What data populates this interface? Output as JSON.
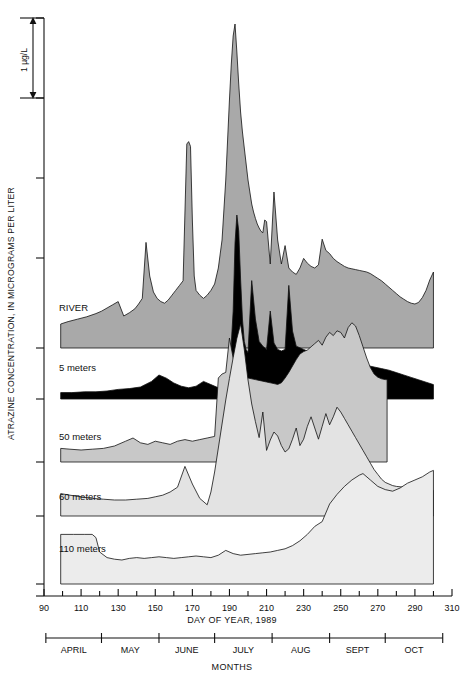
{
  "figure": {
    "y_axis_title": "ATRAZINE CONCENTRATION, IN MICROGRAMS PER LITER",
    "x_axis_title": "DAY OF YEAR, 1989",
    "months_title": "MONTHS",
    "scale_bar_label": "1 µg/L"
  },
  "chart_data": {
    "type": "area",
    "title": "",
    "subtitle": "",
    "xlabel": "DAY OF YEAR, 1989",
    "ylabel": "ATRAZINE CONCENTRATION, IN MICROGRAMS PER LITER",
    "xlim": [
      90,
      310
    ],
    "xticks": [
      90,
      110,
      130,
      150,
      170,
      190,
      210,
      230,
      250,
      270,
      290,
      310
    ],
    "xtick_labels": [
      "90",
      "110",
      "130",
      "150",
      "170",
      "190",
      "210",
      "230",
      "250",
      "270",
      "290",
      "310"
    ],
    "x_minor_tick_step": 10,
    "grid": false,
    "legend": "inline-labels",
    "y_unit": "micrograms per liter",
    "y_scale_bar": {
      "label": "1 µg/L",
      "value": 1
    },
    "stacked_offset_panels": true,
    "months_axis": {
      "label": "MONTHS",
      "labels": [
        "APRIL",
        "MAY",
        "JUNE",
        "JULY",
        "AUG",
        "SEPT",
        "OCT"
      ],
      "boundaries": [
        91,
        121,
        152,
        182,
        213,
        244,
        274,
        305
      ]
    },
    "series": [
      {
        "name": "RIVER",
        "fill": "#a9a9a9",
        "baseline_value": 0,
        "x": [
          99,
          103,
          108,
          113,
          118,
          121,
          124,
          127,
          130,
          133,
          136,
          139,
          141,
          143,
          145,
          147,
          149,
          151,
          153,
          155,
          157,
          159,
          161,
          163,
          165,
          167,
          168,
          169,
          170,
          171,
          172,
          174,
          176,
          178,
          180,
          182,
          184,
          186,
          188,
          190,
          191,
          192,
          193,
          194,
          195,
          196,
          197,
          198,
          199,
          200,
          201,
          202,
          203,
          204,
          205,
          206,
          207,
          208,
          209,
          210,
          212,
          214,
          216,
          218,
          220,
          222,
          224,
          226,
          228,
          230,
          232,
          234,
          236,
          238,
          240,
          242,
          244,
          246,
          248,
          250,
          252,
          254,
          256,
          258,
          260,
          262,
          264,
          266,
          268,
          270,
          272,
          274,
          276,
          278,
          280,
          282,
          284,
          286,
          288,
          290,
          292,
          294,
          296,
          298,
          300
        ],
        "y": [
          0.3,
          0.33,
          0.36,
          0.39,
          0.43,
          0.46,
          0.5,
          0.54,
          0.58,
          0.4,
          0.44,
          0.49,
          0.55,
          0.62,
          1.32,
          0.9,
          0.7,
          0.62,
          0.58,
          0.56,
          0.6,
          0.66,
          0.72,
          0.78,
          0.84,
          2.55,
          2.58,
          2.52,
          1.6,
          0.9,
          0.72,
          0.66,
          0.62,
          0.66,
          0.72,
          0.8,
          1.0,
          1.35,
          2.1,
          3.1,
          3.55,
          3.9,
          4.05,
          3.7,
          3.3,
          2.95,
          2.7,
          2.5,
          2.3,
          2.1,
          1.95,
          1.8,
          1.7,
          1.62,
          1.55,
          1.5,
          1.46,
          1.44,
          1.6,
          1.58,
          1.05,
          1.95,
          1.35,
          1.05,
          1.28,
          1.0,
          0.95,
          0.92,
          1.0,
          1.12,
          1.06,
          1.02,
          1.0,
          1.04,
          1.36,
          1.22,
          1.18,
          1.12,
          1.08,
          1.05,
          1.02,
          1.0,
          0.99,
          0.98,
          0.97,
          0.96,
          0.95,
          0.93,
          0.9,
          0.87,
          0.84,
          0.8,
          0.76,
          0.72,
          0.68,
          0.64,
          0.61,
          0.58,
          0.56,
          0.55,
          0.57,
          0.63,
          0.72,
          0.85,
          0.95
        ]
      },
      {
        "name": "5 meters",
        "fill": "#000000",
        "baseline_value": 0,
        "x": [
          99,
          105,
          112,
          118,
          124,
          130,
          136,
          142,
          148,
          152,
          156,
          160,
          164,
          168,
          172,
          176,
          180,
          184,
          188,
          190,
          192,
          193,
          194,
          195,
          196,
          197,
          198,
          199,
          200,
          202,
          204,
          206,
          208,
          210,
          212,
          214,
          216,
          218,
          220,
          222,
          224,
          226,
          228,
          230,
          232,
          234,
          236,
          238,
          240,
          244,
          248,
          252,
          256,
          260,
          264,
          268,
          272,
          276,
          280,
          284,
          288,
          292,
          296,
          300
        ],
        "y": [
          0.08,
          0.08,
          0.09,
          0.09,
          0.1,
          0.12,
          0.13,
          0.15,
          0.22,
          0.3,
          0.26,
          0.2,
          0.16,
          0.14,
          0.16,
          0.22,
          0.18,
          0.14,
          0.12,
          0.3,
          1.1,
          1.95,
          2.3,
          2.1,
          1.5,
          1.0,
          0.72,
          0.62,
          0.58,
          1.48,
          1.0,
          0.72,
          0.66,
          0.62,
          1.1,
          0.7,
          0.62,
          0.6,
          0.62,
          1.42,
          0.85,
          0.66,
          0.64,
          0.62,
          0.6,
          0.58,
          0.56,
          0.55,
          0.54,
          0.52,
          0.5,
          0.48,
          0.46,
          0.44,
          0.42,
          0.4,
          0.38,
          0.36,
          0.33,
          0.3,
          0.27,
          0.24,
          0.21,
          0.18
        ]
      },
      {
        "name": "50 meters",
        "fill": "#c8c8c8",
        "baseline_value": 0,
        "x": [
          99,
          104,
          110,
          116,
          122,
          128,
          134,
          138,
          142,
          146,
          150,
          154,
          158,
          162,
          166,
          170,
          174,
          178,
          182,
          184,
          186,
          188,
          190,
          192,
          194,
          196,
          198,
          200,
          202,
          204,
          206,
          208,
          210,
          212,
          214,
          216,
          218,
          220,
          222,
          224,
          226,
          228,
          230,
          232,
          234,
          236,
          238,
          240,
          242,
          244,
          246,
          248,
          250,
          252,
          254,
          256,
          258,
          260,
          262,
          264,
          266,
          268,
          270,
          272,
          274,
          275
        ],
        "y": [
          0.17,
          0.16,
          0.15,
          0.16,
          0.17,
          0.2,
          0.26,
          0.3,
          0.24,
          0.22,
          0.26,
          0.24,
          0.22,
          0.26,
          0.28,
          0.26,
          0.28,
          0.3,
          0.32,
          1.05,
          1.1,
          1.12,
          1.55,
          1.3,
          1.12,
          1.08,
          1.06,
          1.05,
          1.04,
          1.03,
          1.02,
          1.01,
          1.0,
          0.99,
          0.98,
          0.97,
          0.99,
          1.05,
          1.12,
          1.2,
          1.28,
          1.35,
          1.38,
          1.4,
          1.44,
          1.48,
          1.52,
          1.46,
          1.56,
          1.62,
          1.58,
          1.64,
          1.62,
          1.55,
          1.68,
          1.74,
          1.7,
          1.58,
          1.44,
          1.3,
          1.18,
          1.1,
          1.06,
          1.04,
          1.03,
          1.03
        ]
      },
      {
        "name": "60 meters",
        "fill": "#e3e3e3",
        "baseline_value": 0,
        "x": [
          99,
          104,
          110,
          116,
          122,
          128,
          134,
          140,
          146,
          150,
          154,
          158,
          162,
          166,
          170,
          174,
          178,
          180,
          182,
          184,
          186,
          188,
          190,
          192,
          194,
          196,
          198,
          200,
          202,
          204,
          206,
          208,
          210,
          212,
          214,
          216,
          218,
          220,
          222,
          224,
          226,
          228,
          230,
          232,
          234,
          236,
          238,
          240,
          242,
          244,
          246,
          248,
          250,
          252,
          254,
          256,
          258,
          260,
          262,
          264,
          266,
          268,
          270,
          272,
          274,
          276,
          278,
          280,
          284,
          288,
          292,
          296,
          300
        ],
        "y": [
          0.28,
          0.26,
          0.24,
          0.22,
          0.21,
          0.2,
          0.2,
          0.21,
          0.22,
          0.24,
          0.26,
          0.3,
          0.36,
          0.62,
          0.4,
          0.22,
          0.14,
          0.3,
          0.55,
          0.85,
          1.15,
          1.45,
          1.72,
          1.98,
          2.22,
          2.4,
          2.08,
          1.7,
          1.4,
          1.18,
          0.98,
          1.3,
          0.82,
          0.95,
          1.05,
          1.0,
          0.88,
          0.8,
          0.84,
          0.96,
          1.1,
          0.88,
          0.96,
          1.12,
          1.24,
          1.1,
          0.96,
          1.12,
          1.28,
          1.14,
          1.24,
          1.36,
          1.3,
          1.22,
          1.14,
          1.06,
          0.98,
          0.9,
          0.82,
          0.74,
          0.66,
          0.58,
          0.52,
          0.46,
          0.42,
          0.4,
          0.38,
          0.37,
          0.36,
          0.35,
          0.34,
          0.33,
          0.32
        ]
      },
      {
        "name": "110 meters",
        "fill": "#ececec",
        "baseline_value": 0,
        "x": [
          99,
          106,
          112,
          116,
          118,
          120,
          124,
          128,
          132,
          136,
          140,
          144,
          148,
          152,
          156,
          160,
          164,
          168,
          172,
          176,
          180,
          184,
          188,
          192,
          196,
          200,
          204,
          208,
          212,
          216,
          220,
          224,
          228,
          232,
          236,
          240,
          244,
          248,
          252,
          256,
          260,
          262,
          266,
          270,
          274,
          278,
          282,
          286,
          290,
          294,
          298,
          300
        ],
        "y": [
          0.62,
          0.62,
          0.62,
          0.62,
          0.58,
          0.4,
          0.33,
          0.31,
          0.3,
          0.32,
          0.33,
          0.32,
          0.33,
          0.34,
          0.33,
          0.32,
          0.33,
          0.34,
          0.35,
          0.34,
          0.33,
          0.36,
          0.42,
          0.38,
          0.36,
          0.37,
          0.38,
          0.39,
          0.4,
          0.42,
          0.44,
          0.48,
          0.54,
          0.62,
          0.72,
          0.78,
          1.0,
          1.12,
          1.22,
          1.3,
          1.36,
          1.38,
          1.3,
          1.22,
          1.18,
          1.16,
          1.2,
          1.26,
          1.3,
          1.34,
          1.4,
          1.42
        ]
      }
    ]
  }
}
